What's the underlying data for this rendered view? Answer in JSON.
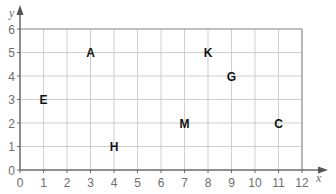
{
  "chart_data": {
    "type": "scatter",
    "title": "",
    "xlabel": "x",
    "ylabel": "y",
    "xlim": [
      0,
      12
    ],
    "ylim": [
      0,
      6
    ],
    "grid": true,
    "x_ticks": [
      "0",
      "1",
      "2",
      "3",
      "4",
      "5",
      "6",
      "7",
      "8",
      "9",
      "10",
      "11",
      "12"
    ],
    "y_ticks": [
      "0",
      "1",
      "2",
      "3",
      "4",
      "5",
      "6"
    ],
    "points": [
      {
        "label": "A",
        "x": 3,
        "y": 5
      },
      {
        "label": "K",
        "x": 8,
        "y": 5
      },
      {
        "label": "G",
        "x": 9,
        "y": 4
      },
      {
        "label": "E",
        "x": 1,
        "y": 3
      },
      {
        "label": "M",
        "x": 7,
        "y": 2
      },
      {
        "label": "C",
        "x": 11,
        "y": 2
      },
      {
        "label": "H",
        "x": 4,
        "y": 1
      }
    ]
  }
}
